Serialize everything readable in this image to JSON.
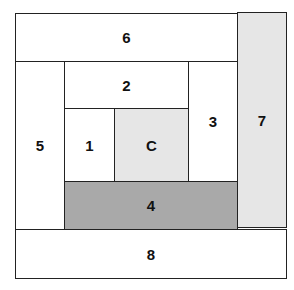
{
  "diagram": {
    "title": "",
    "blocks": [
      {
        "id": "6",
        "label": "6",
        "fill": "#ffffff"
      },
      {
        "id": "7",
        "label": "7",
        "fill": "#e6e6e6"
      },
      {
        "id": "5",
        "label": "5",
        "fill": "#ffffff"
      },
      {
        "id": "2",
        "label": "2",
        "fill": "#ffffff"
      },
      {
        "id": "3",
        "label": "3",
        "fill": "#ffffff"
      },
      {
        "id": "1",
        "label": "1",
        "fill": "#ffffff"
      },
      {
        "id": "C",
        "label": "C",
        "fill": "#e6e6e6"
      },
      {
        "id": "4",
        "label": "4",
        "fill": "#a9a9a9"
      },
      {
        "id": "8",
        "label": "8",
        "fill": "#ffffff"
      }
    ]
  }
}
